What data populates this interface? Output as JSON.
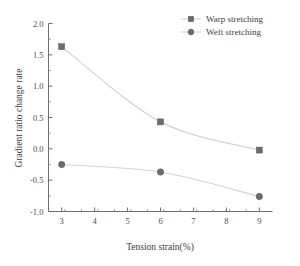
{
  "chart_data": {
    "type": "line",
    "title": "",
    "xlabel": "Tension strain(%)",
    "ylabel": "Gradient ratio change rate",
    "x": [
      3,
      6,
      9
    ],
    "xlim": [
      2.6,
      9.4
    ],
    "ylim": [
      -1.0,
      2.0
    ],
    "xticks": [
      "3",
      "4",
      "5",
      "6",
      "7",
      "8",
      "9"
    ],
    "xtick_values": [
      3,
      4,
      5,
      6,
      7,
      8,
      9
    ],
    "yticks": [
      "2.0",
      "1.5",
      "1.0",
      "0.5",
      "0.0",
      "-0.5",
      "-1.0"
    ],
    "ytick_values": [
      2.0,
      1.5,
      1.0,
      0.5,
      0.0,
      -0.5,
      -1.0
    ],
    "grid": false,
    "legend_position": "top-right",
    "series": [
      {
        "name": "Warp stretching",
        "marker": "square",
        "color": "#6b6b6b",
        "line_color": "#d2d2d2",
        "values": [
          1.63,
          0.43,
          -0.02
        ]
      },
      {
        "name": "Weft stretching",
        "marker": "circle",
        "color": "#6b6b6b",
        "line_color": "#d2d2d2",
        "values": [
          -0.25,
          -0.37,
          -0.76
        ]
      }
    ]
  },
  "legend": {
    "entries": [
      {
        "label": "Warp stretching",
        "marker": "square"
      },
      {
        "label": "Weft stretching",
        "marker": "circle"
      }
    ]
  },
  "axes": {
    "x_title": "Tension strain(%)",
    "y_title": "Gradient ratio change rate",
    "x_tick_labels": [
      "3",
      "4",
      "5",
      "6",
      "7",
      "8",
      "9"
    ],
    "y_tick_labels": [
      "2.0",
      "1.5",
      "1.0",
      "0.5",
      "0.0",
      "-0.5",
      "-1.0"
    ]
  },
  "colors": {
    "marker": "#6b6b6b",
    "line": "#d2d2d2",
    "axis": "#6e6e6e",
    "text": "#3d3d3d",
    "background": "#ffffff"
  }
}
